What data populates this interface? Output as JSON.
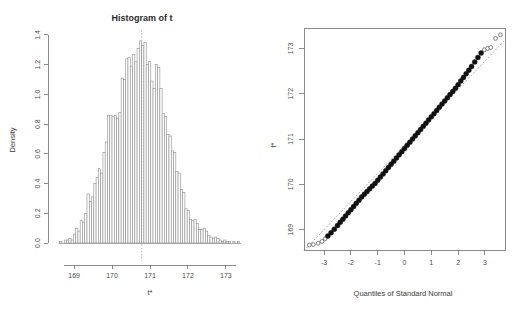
{
  "figure": {
    "background": "#ffffff",
    "panels": 2,
    "layout": "side-by-side"
  },
  "chart_data": [
    {
      "type": "bar",
      "subtype": "histogram",
      "panel": "left",
      "title": "Histogram of t",
      "xlabel": "t*",
      "ylabel": "Density",
      "xlim": [
        168.55,
        173.45
      ],
      "ylim": [
        0.0,
        1.42
      ],
      "xticks": [
        169,
        170,
        171,
        172,
        173
      ],
      "xtick_labels": [
        "169",
        "170",
        "171",
        "172",
        "173"
      ],
      "yticks": [
        0.0,
        0.2,
        0.4,
        0.6,
        0.8,
        1.0,
        1.2,
        1.4
      ],
      "ytick_labels": [
        "0.0",
        "0.2",
        "0.4",
        "0.6",
        "0.8",
        "1.0",
        "1.2",
        "1.4"
      ],
      "grid": false,
      "legend": null,
      "bin_width": 0.06,
      "bin_left_edges": [
        168.62,
        168.68,
        168.74,
        168.8,
        168.86,
        168.92,
        168.98,
        169.04,
        169.1,
        169.16,
        169.22,
        169.28,
        169.34,
        169.4,
        169.46,
        169.52,
        169.58,
        169.64,
        169.7,
        169.76,
        169.82,
        169.88,
        169.94,
        170.0,
        170.06,
        170.12,
        170.18,
        170.24,
        170.3,
        170.36,
        170.42,
        170.48,
        170.54,
        170.6,
        170.66,
        170.72,
        170.78,
        170.84,
        170.9,
        170.96,
        171.02,
        171.08,
        171.14,
        171.2,
        171.26,
        171.32,
        171.38,
        171.44,
        171.5,
        171.56,
        171.62,
        171.68,
        171.74,
        171.8,
        171.86,
        171.92,
        171.98,
        172.04,
        172.1,
        172.16,
        172.22,
        172.28,
        172.34,
        172.4,
        172.46,
        172.52,
        172.58,
        172.64,
        172.7,
        172.76,
        172.82,
        172.88,
        172.94,
        173.0,
        173.06,
        173.12,
        173.18,
        173.24,
        173.3
      ],
      "values": [
        0.01,
        0.0,
        0.02,
        0.02,
        0.03,
        0.02,
        0.06,
        0.1,
        0.08,
        0.15,
        0.14,
        0.2,
        0.33,
        0.28,
        0.31,
        0.4,
        0.44,
        0.5,
        0.47,
        0.61,
        0.68,
        0.86,
        0.86,
        0.85,
        0.86,
        0.84,
        0.88,
        1.11,
        1.1,
        1.24,
        1.25,
        1.19,
        1.27,
        1.22,
        1.31,
        1.36,
        1.33,
        1.35,
        1.2,
        1.22,
        1.09,
        1.04,
        1.2,
        1.18,
        1.04,
        0.87,
        0.85,
        0.73,
        0.72,
        0.62,
        0.61,
        0.48,
        0.47,
        0.36,
        0.34,
        0.23,
        0.22,
        0.16,
        0.15,
        0.16,
        0.13,
        0.09,
        0.09,
        0.1,
        0.08,
        0.05,
        0.04,
        0.03,
        0.04,
        0.03,
        0.02,
        0.01,
        0.02,
        0.01,
        0.01,
        0.0,
        0.01,
        0.0,
        0.01
      ],
      "observed_marker": {
        "value": 170.78,
        "style": "vertical-dashed",
        "color": "#9a9a9a"
      }
    },
    {
      "type": "scatter",
      "subtype": "normal-qq-plot",
      "panel": "right",
      "title": "",
      "xlabel": "Quantiles of Standard Normal",
      "ylabel": "t*",
      "xlim": [
        -3.75,
        3.75
      ],
      "ylim": [
        168.55,
        173.45
      ],
      "xticks": [
        -3,
        -2,
        -1,
        0,
        1,
        2,
        3
      ],
      "xtick_labels": [
        "-3",
        "-2",
        "-1",
        "0",
        "1",
        "2",
        "3"
      ],
      "yticks": [
        169,
        170,
        171,
        172,
        173
      ],
      "ytick_labels": [
        "169",
        "170",
        "171",
        "172",
        "173"
      ],
      "grid": false,
      "legend": null,
      "frame": true,
      "reference_line": {
        "style": "dashed",
        "color": "#7d7d7d",
        "intercept": 170.86,
        "slope": 0.62
      },
      "point_style": {
        "bulk": "filled-circle",
        "tails": "open-circle"
      },
      "x": [
        -3.55,
        -3.4,
        -3.22,
        -3.08,
        -2.96,
        -2.86,
        -2.74,
        -2.62,
        -2.5,
        -2.4,
        -2.3,
        -2.2,
        -2.1,
        -2.0,
        -1.9,
        -1.8,
        -1.7,
        -1.6,
        -1.5,
        -1.4,
        -1.3,
        -1.2,
        -1.1,
        -1.0,
        -0.9,
        -0.8,
        -0.7,
        -0.6,
        -0.5,
        -0.4,
        -0.3,
        -0.2,
        -0.1,
        0.0,
        0.1,
        0.2,
        0.3,
        0.4,
        0.5,
        0.6,
        0.7,
        0.8,
        0.9,
        1.0,
        1.1,
        1.2,
        1.3,
        1.4,
        1.5,
        1.6,
        1.7,
        1.8,
        1.9,
        2.0,
        2.1,
        2.2,
        2.3,
        2.4,
        2.5,
        2.62,
        2.74,
        2.86,
        2.98,
        3.1,
        3.22,
        3.4,
        3.58
      ],
      "y": [
        168.66,
        168.67,
        168.7,
        168.74,
        168.8,
        168.86,
        168.93,
        169.01,
        169.09,
        169.16,
        169.23,
        169.3,
        169.37,
        169.44,
        169.51,
        169.58,
        169.65,
        169.72,
        169.78,
        169.84,
        169.9,
        169.96,
        170.02,
        170.09,
        170.16,
        170.23,
        170.3,
        170.37,
        170.44,
        170.51,
        170.58,
        170.65,
        170.72,
        170.79,
        170.86,
        170.93,
        171.0,
        171.07,
        171.14,
        171.21,
        171.28,
        171.35,
        171.42,
        171.49,
        171.56,
        171.63,
        171.7,
        171.77,
        171.84,
        171.91,
        171.98,
        172.05,
        172.12,
        172.2,
        172.28,
        172.36,
        172.44,
        172.52,
        172.6,
        172.7,
        172.8,
        172.9,
        172.97,
        173.0,
        173.02,
        173.22,
        173.3
      ],
      "open_indices": [
        0,
        1,
        2,
        3,
        4,
        62,
        63,
        64,
        65,
        66
      ]
    }
  ]
}
